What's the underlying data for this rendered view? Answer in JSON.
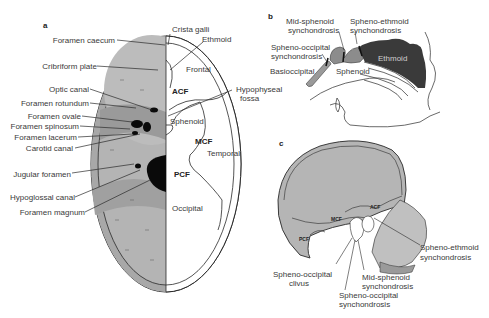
{
  "panels": {
    "a": {
      "letter": "a",
      "left_labels": [
        "Foramen caecum",
        "Cribriform plate",
        "Optic canal",
        "Foramen rotundum",
        "Foramen ovale",
        "Foramen spinosum",
        "Foramen lacerum",
        "Carotid canal",
        "Jugular foramen",
        "Hypoglossal canal",
        "Foramen magnum"
      ],
      "right_labels": {
        "crista_galli": "Crista galli",
        "ethmoid": "Ethmoid",
        "frontal": "Frontal",
        "hypophyseal_1": "Hypophyseal",
        "hypophyseal_2": "fossa",
        "sphenoid": "Sphenoid",
        "temporal": "Temporal",
        "occipital": "Occipital"
      },
      "fossae": {
        "acf": "ACF",
        "mcf": "MCF",
        "pcf": "PCF"
      }
    },
    "b": {
      "letter": "b",
      "labels": {
        "mid_sphenoid_1": "Mid-sphenoid",
        "mid_sphenoid_2": "synchondrosis",
        "spheno_ethmoid_1": "Spheno-ethmoid",
        "spheno_ethmoid_2": "synchondrosis",
        "spheno_occipital_1": "Spheno-occipital",
        "spheno_occipital_2": "synchondrosis",
        "basioccipital": "Basioccipital",
        "sphenoid": "Sphenoid",
        "ethmoid": "Ethmoid"
      }
    },
    "c": {
      "letter": "c",
      "fossae": {
        "acf": "ACF",
        "mcf": "MCF",
        "pcf": "PCF"
      },
      "labels": {
        "spheno_ethmoid_1": "Spheno-ethmoid",
        "spheno_ethmoid_2": "synchondrosis",
        "spheno_occipital_clivus_1": "Spheno-occipital",
        "spheno_occipital_clivus_2": "clivus",
        "mid_sphenoid_1": "Mid-sphenoid",
        "mid_sphenoid_2": "synchondrosis",
        "spheno_occipital_1": "Spheno-occipital",
        "spheno_occipital_2": "synchondrosis"
      }
    }
  },
  "colors": {
    "bone_gray": "#a9a9a9",
    "bone_light": "#c8c8c8",
    "dark_ethmoid": "#3a3a3a",
    "foramen_black": "#0a0a0a",
    "outline": "#2a2a2a",
    "skull_fill": "#b5b5b5"
  }
}
